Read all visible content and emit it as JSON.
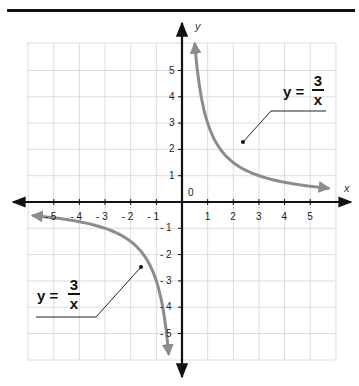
{
  "diagram": {
    "type": "function-graph",
    "function": "y = 3/x",
    "colors": {
      "rule": "#111111",
      "grid": "#d0d0d0",
      "axes": "#111111",
      "curve": "#8c8c8c",
      "leader": "#222222"
    },
    "axes": {
      "x_label": "x",
      "y_label": "y",
      "origin_label": "0",
      "x_ticks": [
        {
          "value": -5,
          "label": "- 5"
        },
        {
          "value": -4,
          "label": "- 4"
        },
        {
          "value": -3,
          "label": "- 3"
        },
        {
          "value": -2,
          "label": "- 2"
        },
        {
          "value": -1,
          "label": "- 1"
        },
        {
          "value": 1,
          "label": "1"
        },
        {
          "value": 2,
          "label": "2"
        },
        {
          "value": 3,
          "label": "3"
        },
        {
          "value": 4,
          "label": "4"
        },
        {
          "value": 5,
          "label": "5"
        }
      ],
      "y_ticks": [
        {
          "value": 5,
          "label": "5"
        },
        {
          "value": 4,
          "label": "4"
        },
        {
          "value": 3,
          "label": "3"
        },
        {
          "value": 2,
          "label": "2"
        },
        {
          "value": 1,
          "label": "1"
        },
        {
          "value": -1,
          "label": "- 1"
        },
        {
          "value": -2,
          "label": "- 2"
        },
        {
          "value": -3,
          "label": "- 3"
        },
        {
          "value": -4,
          "label": "- 4"
        },
        {
          "value": -5,
          "label": "- 5"
        }
      ],
      "x_range": [
        -6,
        6
      ],
      "y_range": [
        -6,
        6
      ]
    },
    "labels": {
      "upper": {
        "lhs": "y =",
        "numerator": "3",
        "denominator": "x"
      },
      "lower": {
        "lhs": "y =",
        "numerator": "3",
        "denominator": "x"
      }
    }
  }
}
